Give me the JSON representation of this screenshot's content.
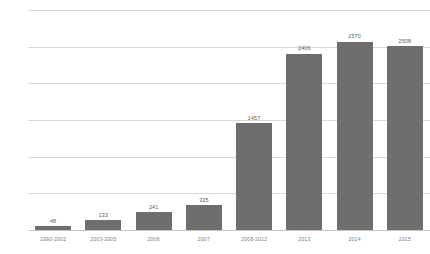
{
  "chart_data": {
    "type": "bar",
    "title": "",
    "subtitle": "",
    "xlabel": "",
    "ylabel": "",
    "categories": [
      "1990-2002",
      "2003-2005",
      "2006",
      "2007",
      "2008-2012",
      "2013",
      "2014",
      "2015"
    ],
    "values": [
      48,
      133,
      241,
      335,
      1457,
      2406,
      2570,
      2508
    ],
    "value_labels": [
      "48",
      "133",
      "241",
      "335",
      "1457",
      "2406",
      "2570",
      "2508"
    ],
    "ylim": [
      0,
      3000
    ],
    "yticks": [
      0,
      500,
      1000,
      1500,
      2000,
      2500,
      3000
    ],
    "ytick_labels": [
      "0",
      "500",
      "1000",
      "1500",
      "2000",
      "2500",
      "3000"
    ],
    "grid": true,
    "legend": "none",
    "series": [
      {
        "name": "",
        "values": [
          48,
          133,
          241,
          335,
          1457,
          2406,
          2570,
          2508
        ]
      }
    ],
    "colors": {
      "bar": "#6e6e6e",
      "gridline": "#d9d9d9",
      "axis_text": "#8a8a8a",
      "value_text": "#5a5a5a",
      "background": "#ffffff"
    }
  }
}
